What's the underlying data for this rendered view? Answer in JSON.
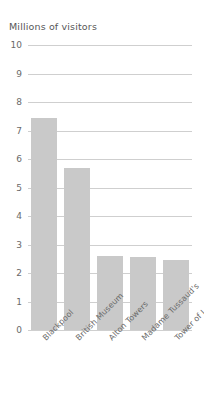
{
  "chart_data": {
    "type": "bar",
    "title": "Millions of visitors",
    "xlabel": "",
    "ylabel": "Millions of visitors",
    "categories": [
      "Blackpool",
      "British Museum",
      "Alton Towers",
      "Madame Tussaud's",
      "Tower of London"
    ],
    "values": [
      7.45,
      5.7,
      2.6,
      2.55,
      2.45
    ],
    "ylim": [
      0,
      10
    ],
    "yticks": [
      "0",
      "1",
      "2",
      "3",
      "4",
      "5",
      "6",
      "7",
      "8",
      "9",
      "10"
    ],
    "grid": true,
    "legend": "none",
    "bar_color": "#c9c9c9",
    "grid_color": "#cfcfcf",
    "text_color": "#6a6a6a",
    "title_color": "#575757",
    "background": "#ffffff"
  }
}
